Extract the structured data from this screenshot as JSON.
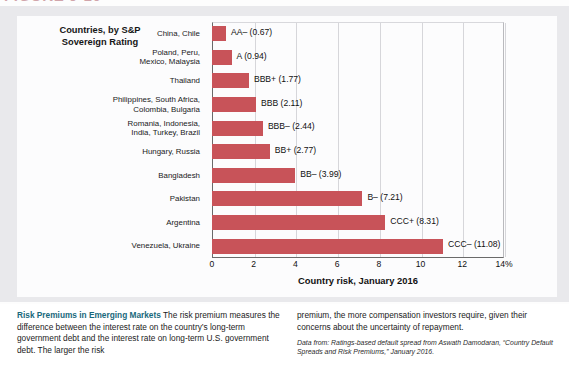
{
  "figure": {
    "number_label": "FIGURE 9-10"
  },
  "chart_data": {
    "type": "bar",
    "orientation": "horizontal",
    "title": "",
    "category_header": "Countries, by S&P\nSovereign Rating",
    "xlabel": "Country risk, January 2016",
    "ylabel": "",
    "xlim": [
      0,
      14
    ],
    "xticks": [
      0,
      2,
      4,
      6,
      8,
      10,
      12,
      14
    ],
    "xticklabels": [
      "0",
      "2",
      "4",
      "6",
      "8",
      "10",
      "12",
      "14%"
    ],
    "grid": true,
    "grid_axis": "x",
    "legend": "none",
    "bar_color": "#c85359",
    "categories": [
      "China, Chile",
      "Poland, Peru, Mexico, Malaysia",
      "Thailand",
      "Philippines, South Africa, Colombia, Bulgaria",
      "Romania, Indonesia, India, Turkey, Brazil",
      "Hungary, Russia",
      "Bangladesh",
      "Pakistan",
      "Argentina",
      "Venezuela, Ukraine"
    ],
    "values": [
      0.67,
      0.94,
      1.77,
      2.11,
      2.44,
      2.77,
      3.99,
      7.21,
      8.31,
      11.08
    ],
    "data_labels": [
      "AA– (0.67)",
      "A (0.94)",
      "BBB+ (1.77)",
      "BBB (2.11)",
      "BBB– (2.44)",
      "BB+ (2.77)",
      "BB– (3.99)",
      "B– (7.21)",
      "CCC+ (8.31)",
      "CCC– (11.08)"
    ],
    "rows": [
      {
        "label_lines": [
          "China, Chile"
        ],
        "value": 0.67,
        "data_label": "AA– (0.67)",
        "rating": "AA–"
      },
      {
        "label_lines": [
          "Poland, Peru,",
          "Mexico, Malaysia"
        ],
        "value": 0.94,
        "data_label": "A (0.94)",
        "rating": "A"
      },
      {
        "label_lines": [
          "Thailand"
        ],
        "value": 1.77,
        "data_label": "BBB+ (1.77)",
        "rating": "BBB+"
      },
      {
        "label_lines": [
          "Philippines, South Africa,",
          "Colombia, Bulgaria"
        ],
        "value": 2.11,
        "data_label": "BBB (2.11)",
        "rating": "BBB"
      },
      {
        "label_lines": [
          "Romania, Indonesia,",
          "India, Turkey, Brazil"
        ],
        "value": 2.44,
        "data_label": "BBB– (2.44)",
        "rating": "BBB–"
      },
      {
        "label_lines": [
          "Hungary, Russia"
        ],
        "value": 2.77,
        "data_label": "BB+ (2.77)",
        "rating": "BB+"
      },
      {
        "label_lines": [
          "Bangladesh"
        ],
        "value": 3.99,
        "data_label": "BB– (3.99)",
        "rating": "BB–"
      },
      {
        "label_lines": [
          "Pakistan"
        ],
        "value": 7.21,
        "data_label": "B– (7.21)",
        "rating": "B–"
      },
      {
        "label_lines": [
          "Argentina"
        ],
        "value": 8.31,
        "data_label": "CCC+ (8.31)",
        "rating": "CCC+"
      },
      {
        "label_lines": [
          "Venezuela, Ukraine"
        ],
        "value": 11.08,
        "data_label": "CCC– (11.08)",
        "rating": "CCC–"
      }
    ]
  },
  "chart_heading": {
    "line1": "Countries, by S&P",
    "line2": "Sovereign Rating"
  },
  "caption": {
    "title": "Risk Premiums in Emerging Markets",
    "left_text": "The risk premium measures the difference between the interest rate on the country’s long-term government debt and the interest rate on long-term U.S. government debt. The larger the risk",
    "right_text": "premium, the more compensation investors require, given their concerns about the uncertainty of repayment.",
    "source": "Data from: Ratings-based default spread from Aswath Damodaran, “Country Default Spreads and Risk Premiums,” January 2016."
  }
}
